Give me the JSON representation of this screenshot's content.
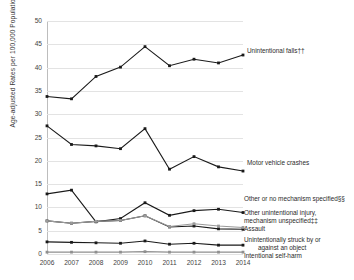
{
  "chart": {
    "type": "line",
    "title": "",
    "ylabel": "Age-adjusted Rates per 100,000 Population",
    "xlabel": ""
  },
  "axes": {
    "y_ticks": [
      "0",
      "5",
      "10",
      "15",
      "20",
      "25",
      "30",
      "35",
      "40",
      "45",
      "50"
    ],
    "x_ticks": [
      "2006",
      "2007",
      "2008",
      "2009",
      "2010",
      "2011",
      "2012",
      "2013",
      "2014"
    ]
  },
  "labels": {
    "falls": "Unintentional falls††",
    "motor": "Motor vehicle crashes",
    "other_no_mech": "Other or no mechanism specified§§",
    "other_unint_1": "Other unintentional injury,",
    "other_unint_2": "mechanism unspecified‡‡",
    "assault": "Assault",
    "struck_1": "Unintentionally struck by or",
    "struck_2": "against an object",
    "self_harm": "Intentional self-harm"
  },
  "chart_data": {
    "type": "line",
    "title": "",
    "xlabel": "",
    "ylabel": "Age-adjusted Rates per 100,000 Population",
    "x": [
      2006,
      2007,
      2008,
      2009,
      2010,
      2011,
      2012,
      2013,
      2014
    ],
    "categories": [
      "2006",
      "2007",
      "2008",
      "2009",
      "2010",
      "2011",
      "2012",
      "2013",
      "2014"
    ],
    "ylim": [
      0,
      50
    ],
    "yticks": [
      0,
      5,
      10,
      15,
      20,
      25,
      30,
      35,
      40,
      45,
      50
    ],
    "grid": true,
    "legend": "right-inline-annotations",
    "series": [
      {
        "name": "Unintentional falls††",
        "color": "#1a1a1a",
        "values": [
          33.8,
          33.3,
          38.1,
          40.1,
          44.5,
          40.4,
          41.8,
          41.0,
          42.7
        ]
      },
      {
        "name": "Motor vehicle crashes",
        "color": "#1a1a1a",
        "values": [
          27.5,
          23.5,
          23.2,
          22.6,
          26.9,
          18.2,
          20.9,
          18.7,
          17.8
        ]
      },
      {
        "name": "Other or no mechanism specified§§",
        "color": "#1a1a1a",
        "values": [
          12.9,
          13.7,
          6.9,
          7.6,
          11.0,
          8.3,
          9.3,
          9.6,
          8.9
        ]
      },
      {
        "name": "Other unintentional injury, mechanism unspecified‡‡",
        "color": "#1a1a1a",
        "values": [
          7.1,
          6.6,
          7.0,
          7.2,
          8.2,
          5.8,
          6.0,
          5.4,
          5.3
        ]
      },
      {
        "name": "Assault",
        "color": "#9a9a9a",
        "values": [
          7.1,
          6.6,
          7.0,
          7.2,
          8.2,
          5.9,
          6.5,
          6.0,
          5.7
        ]
      },
      {
        "name": "Unintentionally struck by or against an object",
        "color": "#1a1a1a",
        "values": [
          2.6,
          2.5,
          2.4,
          2.3,
          2.8,
          2.1,
          2.3,
          1.9,
          1.9
        ]
      },
      {
        "name": "Intentional self-harm",
        "color": "#8f8f8f",
        "values": [
          0.4,
          0.4,
          0.4,
          0.4,
          0.5,
          0.4,
          0.4,
          0.4,
          0.4
        ]
      }
    ]
  }
}
